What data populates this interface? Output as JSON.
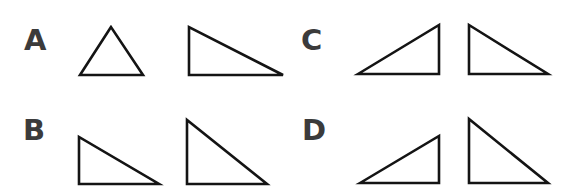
{
  "figure": {
    "stroke_color": "#141414",
    "label_color": "#3b3b3b",
    "background": "#ffffff",
    "options": [
      {
        "label": "A",
        "label_pos": [
          24,
          26
        ],
        "triangles": [
          {
            "name": "equilateral-triangle",
            "points": "111,27 80,75 143,75"
          },
          {
            "name": "right-triangle-left-angle",
            "points": "189,27 189,75 283,75"
          }
        ]
      },
      {
        "label": "B",
        "label_pos": [
          23,
          116
        ],
        "triangles": [
          {
            "name": "right-triangle-left-angle-small",
            "points": "79,137 79,184 159,184"
          },
          {
            "name": "right-triangle-left-angle-tall",
            "points": "187,120 187,184 267,184"
          }
        ]
      },
      {
        "label": "C",
        "label_pos": [
          301,
          26
        ],
        "triangles": [
          {
            "name": "right-triangle-right-angle",
            "points": "358,74 439,25 439,74"
          },
          {
            "name": "right-triangle-left-angle",
            "points": "469,25 469,74 548,74"
          }
        ]
      },
      {
        "label": "D",
        "label_pos": [
          302,
          116
        ],
        "triangles": [
          {
            "name": "right-triangle-right-angle-small",
            "points": "360,183 439,136 439,183"
          },
          {
            "name": "right-triangle-left-angle-tall",
            "points": "469,119 469,183 548,183"
          }
        ]
      }
    ]
  }
}
